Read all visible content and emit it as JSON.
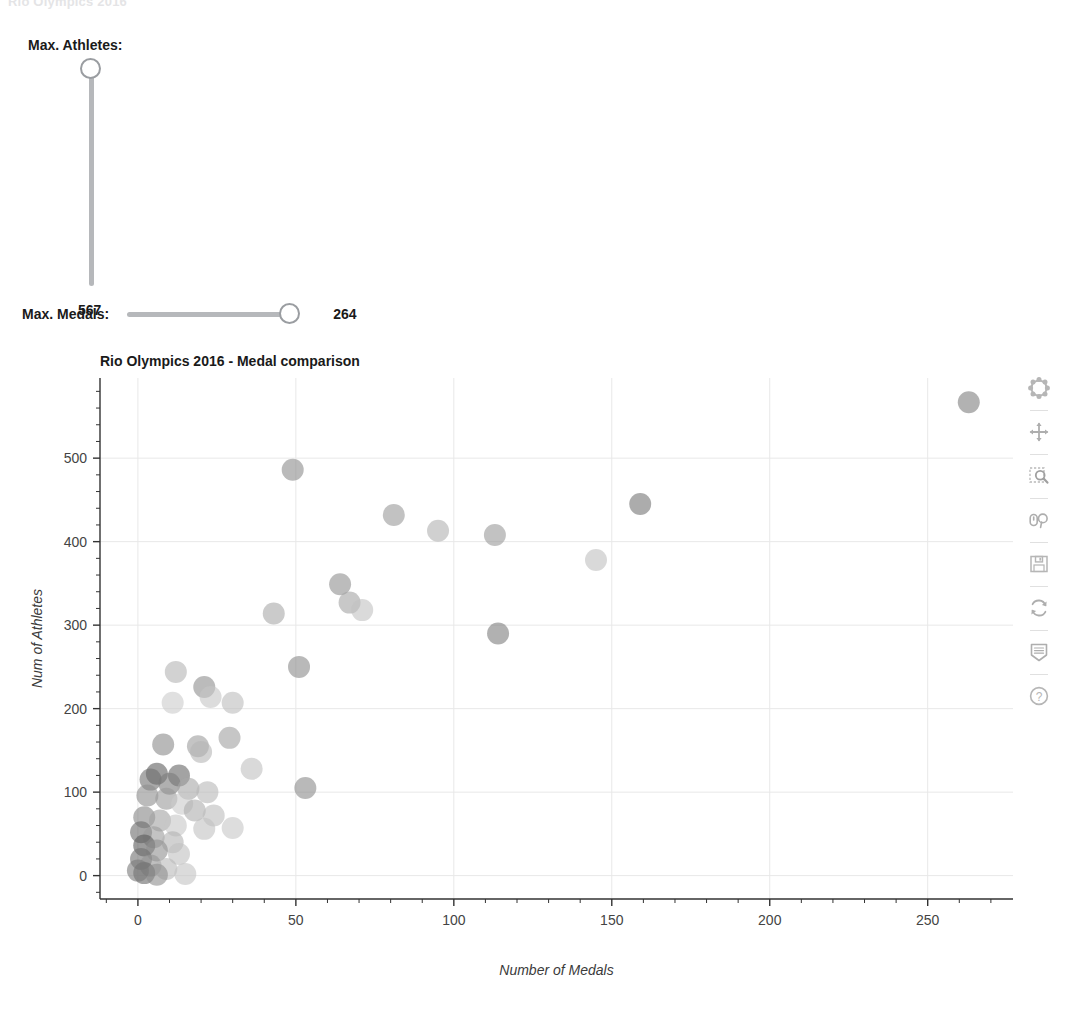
{
  "ghost_row": "Rio Olympics 2016",
  "controls": {
    "athletes_slider": {
      "label": "Max. Athletes:",
      "value": "567",
      "orientation": "vertical",
      "min": 0,
      "max": 567
    },
    "medals_slider": {
      "label": "Max. Medals:",
      "value": "264",
      "orientation": "horizontal",
      "min": 0,
      "max": 264
    }
  },
  "toolbar": {
    "items": [
      {
        "name": "bokeh-logo-icon",
        "label": "Bokeh"
      },
      {
        "name": "pan-icon",
        "label": "Pan"
      },
      {
        "name": "box-zoom-icon",
        "label": "Box Zoom"
      },
      {
        "name": "wheel-zoom-icon",
        "label": "Wheel Zoom"
      },
      {
        "name": "save-icon",
        "label": "Save"
      },
      {
        "name": "reset-icon",
        "label": "Reset"
      },
      {
        "name": "hover-icon",
        "label": "Hover"
      },
      {
        "name": "help-icon",
        "label": "Help"
      }
    ]
  },
  "chart_data": {
    "type": "scatter",
    "title": "Rio Olympics 2016 - Medal comparison",
    "xlabel": "Number of Medals",
    "ylabel": "Num of Athletes",
    "xlim": [
      -12,
      277
    ],
    "ylim": [
      -28,
      596
    ],
    "xticks": [
      0,
      50,
      100,
      150,
      200,
      250
    ],
    "yticks": [
      0,
      100,
      200,
      300,
      400,
      500
    ],
    "x_minor_step": 10,
    "y_minor_step": 20,
    "grid": true,
    "legend": null,
    "marker": "circle",
    "marker_size": 22,
    "marker_alpha": 0.6,
    "points": [
      {
        "x": 263,
        "y": 567,
        "color": "#7f7f7f"
      },
      {
        "x": 49,
        "y": 486,
        "color": "#8c8c8c"
      },
      {
        "x": 159,
        "y": 445,
        "color": "#757575"
      },
      {
        "x": 81,
        "y": 432,
        "color": "#9a9a9a"
      },
      {
        "x": 95,
        "y": 413,
        "color": "#b0b0b0"
      },
      {
        "x": 113,
        "y": 408,
        "color": "#9a9a9a"
      },
      {
        "x": 145,
        "y": 378,
        "color": "#c0c0c0"
      },
      {
        "x": 64,
        "y": 349,
        "color": "#8f8f8f"
      },
      {
        "x": 67,
        "y": 327,
        "color": "#a3a3a3"
      },
      {
        "x": 71,
        "y": 318,
        "color": "#c2c2c2"
      },
      {
        "x": 43,
        "y": 314,
        "color": "#a8a8a8"
      },
      {
        "x": 114,
        "y": 290,
        "color": "#7d7d7d"
      },
      {
        "x": 51,
        "y": 250,
        "color": "#8a8a8a"
      },
      {
        "x": 12,
        "y": 244,
        "color": "#b4b4b4"
      },
      {
        "x": 21,
        "y": 226,
        "color": "#8d8d8d"
      },
      {
        "x": 23,
        "y": 214,
        "color": "#c4c4c4"
      },
      {
        "x": 11,
        "y": 207,
        "color": "#cccccc"
      },
      {
        "x": 30,
        "y": 207,
        "color": "#bdbdbd"
      },
      {
        "x": 29,
        "y": 165,
        "color": "#a0a0a0"
      },
      {
        "x": 8,
        "y": 157,
        "color": "#8b8b8b"
      },
      {
        "x": 19,
        "y": 155,
        "color": "#9d9d9d"
      },
      {
        "x": 20,
        "y": 148,
        "color": "#b5b5b5"
      },
      {
        "x": 36,
        "y": 128,
        "color": "#bfbfbf"
      },
      {
        "x": 53,
        "y": 105,
        "color": "#8a8a8a"
      },
      {
        "x": 6,
        "y": 122,
        "color": "#5e5e5e"
      },
      {
        "x": 13,
        "y": 120,
        "color": "#666666"
      },
      {
        "x": 4,
        "y": 115,
        "color": "#707070"
      },
      {
        "x": 10,
        "y": 110,
        "color": "#7b7b7b"
      },
      {
        "x": 16,
        "y": 104,
        "color": "#a6a6a6"
      },
      {
        "x": 22,
        "y": 100,
        "color": "#b8b8b8"
      },
      {
        "x": 3,
        "y": 96,
        "color": "#8e8e8e"
      },
      {
        "x": 9,
        "y": 92,
        "color": "#999999"
      },
      {
        "x": 14,
        "y": 86,
        "color": "#c9c9c9"
      },
      {
        "x": 18,
        "y": 78,
        "color": "#aeaeae"
      },
      {
        "x": 24,
        "y": 72,
        "color": "#bcbcbc"
      },
      {
        "x": 2,
        "y": 70,
        "color": "#858585"
      },
      {
        "x": 7,
        "y": 66,
        "color": "#a2a2a2"
      },
      {
        "x": 12,
        "y": 60,
        "color": "#c6c6c6"
      },
      {
        "x": 21,
        "y": 56,
        "color": "#c1c1c1"
      },
      {
        "x": 30,
        "y": 57,
        "color": "#c7c7c7"
      },
      {
        "x": 1,
        "y": 52,
        "color": "#6b6b6b"
      },
      {
        "x": 5,
        "y": 46,
        "color": "#9b9b9b"
      },
      {
        "x": 11,
        "y": 40,
        "color": "#b2b2b2"
      },
      {
        "x": 2,
        "y": 36,
        "color": "#5a5a5a"
      },
      {
        "x": 6,
        "y": 30,
        "color": "#8f8f8f"
      },
      {
        "x": 13,
        "y": 26,
        "color": "#c0c0c0"
      },
      {
        "x": 1,
        "y": 20,
        "color": "#707070"
      },
      {
        "x": 4,
        "y": 12,
        "color": "#949494"
      },
      {
        "x": 9,
        "y": 8,
        "color": "#b9b9b9"
      },
      {
        "x": 2,
        "y": 3,
        "color": "#676767"
      },
      {
        "x": 6,
        "y": 1,
        "color": "#8d8d8d"
      },
      {
        "x": 0,
        "y": 6,
        "color": "#7a7a7a"
      },
      {
        "x": 15,
        "y": 2,
        "color": "#c3c3c3"
      }
    ]
  }
}
